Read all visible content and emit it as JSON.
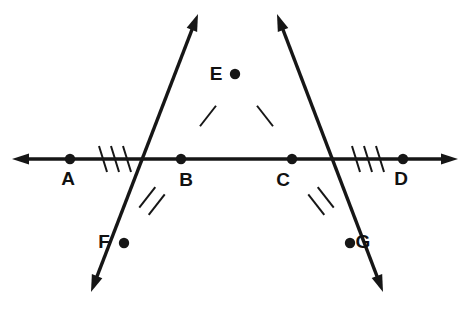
{
  "figure": {
    "background_color": "#ffffff",
    "stroke_color": "#161616",
    "label_color": "#111111",
    "width": 469,
    "height": 314
  },
  "points": [
    {
      "id": "A",
      "label": "A",
      "x": 70,
      "y": 159,
      "label_x": 68,
      "label_y": 185
    },
    {
      "id": "B",
      "label": "B",
      "x": 181,
      "y": 159,
      "label_x": 186,
      "label_y": 186
    },
    {
      "id": "C",
      "label": "C",
      "x": 292,
      "y": 159,
      "label_x": 283,
      "label_y": 186
    },
    {
      "id": "D",
      "label": "D",
      "x": 403,
      "y": 159,
      "label_x": 401,
      "label_y": 185
    },
    {
      "id": "E",
      "label": "E",
      "x": 235,
      "y": 74,
      "label_x": 216,
      "label_y": 80
    },
    {
      "id": "F",
      "label": "F",
      "x": 124,
      "y": 243,
      "label_x": 104,
      "label_y": 248
    },
    {
      "id": "G",
      "label": "G",
      "x": 350,
      "y": 243,
      "label_x": 363,
      "label_y": 248
    }
  ],
  "lines": [
    {
      "id": "horizontal-line-AD",
      "name": "line-AD",
      "from_x": 12,
      "from_y": 159,
      "to_x": 458,
      "to_y": 159,
      "arrow_start": true,
      "arrow_end": true
    },
    {
      "id": "ray-line-FE",
      "name": "line-through-F-B-E",
      "from_x": 91,
      "from_y": 292,
      "to_x": 198,
      "to_y": 14,
      "arrow_start": true,
      "arrow_end": true
    },
    {
      "id": "ray-line-GE",
      "name": "line-through-G-C-E",
      "from_x": 383,
      "from_y": 292,
      "to_x": 277,
      "to_y": 14,
      "arrow_start": true,
      "arrow_end": true
    }
  ],
  "tick_marks": [
    {
      "id": "ticks-AB",
      "segment": "AB",
      "count": 3,
      "center_x": 115,
      "center_y": 159,
      "angle": 0,
      "spacing": 12,
      "length": 26,
      "slant": 8
    },
    {
      "id": "ticks-CD",
      "segment": "CD",
      "count": 3,
      "center_x": 368,
      "center_y": 159,
      "angle": 0,
      "spacing": 12,
      "length": 26,
      "slant": 8
    },
    {
      "id": "ticks-BE",
      "segment": "BE",
      "count": 1,
      "center_x": 208,
      "center_y": 116,
      "angle": 38,
      "spacing": 11,
      "length": 26,
      "slant": 0
    },
    {
      "id": "ticks-CE",
      "segment": "CE",
      "count": 1,
      "center_x": 265,
      "center_y": 116,
      "angle": -38,
      "spacing": 11,
      "length": 26,
      "slant": 0
    },
    {
      "id": "ticks-BF",
      "segment": "BF",
      "count": 2,
      "center_x": 152,
      "center_y": 201,
      "angle": 38,
      "spacing": 12,
      "length": 26,
      "slant": 0
    },
    {
      "id": "ticks-CG",
      "segment": "CG",
      "count": 2,
      "center_x": 321,
      "center_y": 201,
      "angle": -38,
      "spacing": 12,
      "length": 26,
      "slant": 0
    }
  ],
  "annotations": {
    "equal_segments_single": [
      "BE",
      "CE"
    ],
    "equal_segments_double": [
      "BF",
      "CG"
    ],
    "equal_segments_triple": [
      "AB",
      "CD"
    ]
  }
}
